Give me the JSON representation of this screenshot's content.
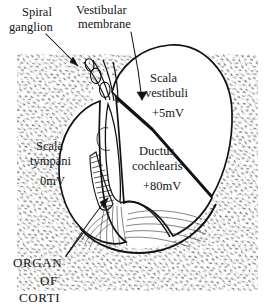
{
  "figure": {
    "type": "anatomical-diagram",
    "background_color": "#ffffff",
    "ink_color": "#141414",
    "stipple_color": "#2b2b2b"
  },
  "labels": {
    "spiral_ganglion": {
      "line1": "Spiral",
      "line2": "ganglion"
    },
    "vestibular_membrane": {
      "line1": "Vestibular",
      "line2": "membrane"
    },
    "scala_vestibuli": {
      "line1": "Scala",
      "line2": "vestibuli",
      "value": "+5mV"
    },
    "scala_tympani": {
      "line1": "Scala",
      "line2": "tympani",
      "value": "0mV"
    },
    "ductus_cochlearis": {
      "line1": "Ductus",
      "line2": "cochlearis",
      "value": "+80mV"
    },
    "organ_of_corti": {
      "line1": "ORGAN",
      "line2": "OF",
      "line3": "CORTI"
    }
  },
  "potentials": [
    {
      "compartment": "Scala vestibuli",
      "value_mv": 5,
      "text": "+5mV"
    },
    {
      "compartment": "Ductus cochlearis",
      "value_mv": 80,
      "text": "+80mV"
    },
    {
      "compartment": "Scala tympani",
      "value_mv": 0,
      "text": "0mV"
    }
  ],
  "structures": [
    "bone (stippled)",
    "spiral ganglion",
    "vestibular (Reissner's) membrane",
    "spiral limbus",
    "stria vascularis",
    "basilar membrane",
    "organ of Corti"
  ]
}
